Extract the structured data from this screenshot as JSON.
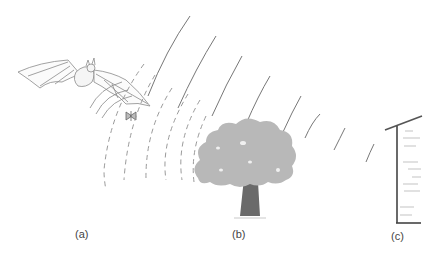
{
  "diagram": {
    "labels": {
      "a": "(a)",
      "b": "(b)",
      "c": "(c)"
    },
    "elements": {
      "bat": "bat-icon",
      "moth": "moth-icon",
      "tree": "tree-icon",
      "wall": "wall-icon",
      "emitted_waves": "solid-arc-waves",
      "echo_waves": "dashed-arc-waves"
    },
    "colors": {
      "wave_solid": "#777777",
      "wave_dashed": "#999999",
      "tree_canopy": "#b8b8b8",
      "tree_trunk": "#6a6a6a",
      "wall": "#555555",
      "bat_outline": "#888888",
      "label_text": "#444444"
    }
  }
}
